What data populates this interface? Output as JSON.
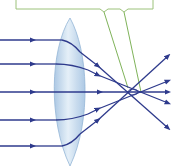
{
  "diagram": {
    "type": "optics-ray-diagram",
    "callout": {
      "text": "",
      "border_color": "#9cc27a",
      "pointer_color": "#7fb35a"
    },
    "lens": {
      "fill_color": "#c7dcee",
      "edge_color": "#8fb3d4"
    },
    "rays": {
      "count": 5,
      "color": "#2e3a8c",
      "heights_px": [
        40,
        64,
        92,
        120,
        146
      ]
    },
    "colors": {
      "background": "#ffffff",
      "ray": "#2e3a8c",
      "lens": "#c7dcee",
      "callout": "#9cc27a"
    }
  }
}
